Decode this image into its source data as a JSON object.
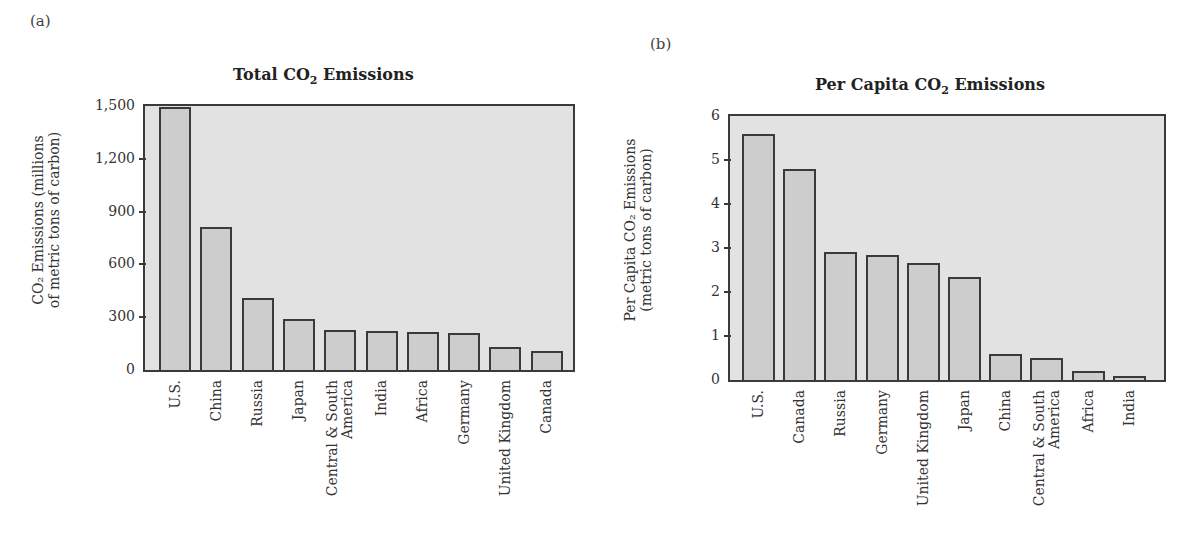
{
  "panels": [
    {
      "label": "(a)"
    },
    {
      "label": "(b)"
    }
  ],
  "colors": {
    "plot_background": "#e2e2e2",
    "bar_fill": "#cdcdcd",
    "bar_outline": "#3a3a3a"
  },
  "chart_data": [
    {
      "type": "bar",
      "panel": "(a)",
      "title": "Total CO2 Emissions",
      "title_parts": {
        "pre": "Total CO",
        "sub": "2",
        "post": " Emissions"
      },
      "xlabel": "",
      "ylabel": "CO2 Emissions (millions of metric tons of carbon)",
      "ylabel_lines": [
        "CO₂ Emissions (millions",
        "of metric tons of carbon)"
      ],
      "ylim": [
        0,
        1500
      ],
      "yticks": [
        0,
        300,
        600,
        900,
        1200,
        1500
      ],
      "ytick_labels": [
        "0",
        "300",
        "600",
        "900",
        "1,200",
        "1,500"
      ],
      "grid": false,
      "categories": [
        "U.S.",
        "China",
        "Russia",
        "Japan",
        "Central & South\nAmerica",
        "India",
        "Africa",
        "Germany",
        "United Kingdom",
        "Canada"
      ],
      "values": [
        1495,
        815,
        410,
        290,
        228,
        220,
        215,
        208,
        130,
        110
      ]
    },
    {
      "type": "bar",
      "panel": "(b)",
      "title": "Per Capita CO2 Emissions",
      "title_parts": {
        "pre": "Per Capita CO",
        "sub": "2",
        "post": " Emissions"
      },
      "xlabel": "",
      "ylabel": "Per Capita CO2 Emissions (metric tons of carbon)",
      "ylabel_lines": [
        "Per Capita CO₂ Emissions",
        "(metric tons of carbon)"
      ],
      "ylim": [
        0,
        6
      ],
      "yticks": [
        0,
        1,
        2,
        3,
        4,
        5,
        6
      ],
      "ytick_labels": [
        "0",
        "1",
        "2",
        "3",
        "4",
        "5",
        "6"
      ],
      "grid": false,
      "categories": [
        "U.S.",
        "Canada",
        "Russia",
        "Germany",
        "United Kingdom",
        "Japan",
        "China",
        "Central & South\nAmerica",
        "Africa",
        "India"
      ],
      "values": [
        5.6,
        4.8,
        2.9,
        2.85,
        2.65,
        2.35,
        0.6,
        0.5,
        0.2,
        0.1
      ]
    }
  ]
}
